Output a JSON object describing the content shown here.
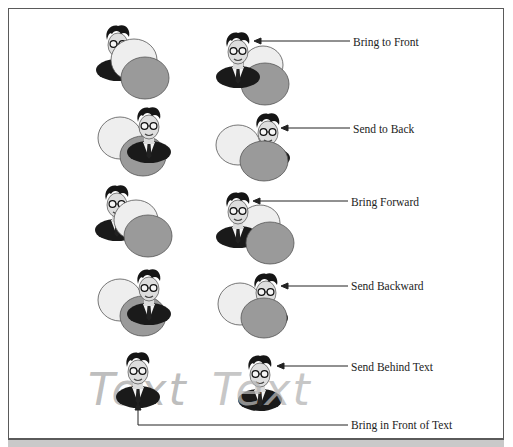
{
  "figure": {
    "type": "layering-order-diagram",
    "rows": [
      {
        "id": "bring-to-front",
        "label": "Bring to Front",
        "label_pos": [
          353,
          37
        ]
      },
      {
        "id": "send-to-back",
        "label": "Send to Back",
        "label_pos": [
          353,
          124
        ]
      },
      {
        "id": "bring-forward",
        "label": "Bring Forward",
        "label_pos": [
          351,
          198
        ]
      },
      {
        "id": "send-backward",
        "label": "Send Backward",
        "label_pos": [
          351,
          281
        ]
      },
      {
        "id": "send-behind-text",
        "label": "Send Behind Text",
        "label_pos": [
          351,
          362
        ]
      },
      {
        "id": "bring-in-front-of-text",
        "label": "Bring in Front of Text",
        "label_pos": [
          351,
          421
        ]
      }
    ],
    "watermark_text": [
      "Text",
      "Text"
    ],
    "colors": {
      "frame": "#5a5a5a",
      "light_oval": "#eeeeee",
      "dark_oval": "#9a9a9a",
      "oval_stroke": "#555555",
      "suit": "#1a1a1a",
      "watermark": "#b5b5b5",
      "band": "#c9c9c9"
    }
  }
}
